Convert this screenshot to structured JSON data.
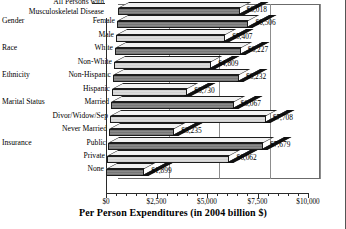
{
  "chart_data": {
    "type": "bar",
    "orientation": "horizontal",
    "title": "",
    "xlabel": "Per Person Expenditures (in 2004 billion $)",
    "ylabel": "",
    "xlim": [
      0,
      10000
    ],
    "xticks": [
      "$0",
      "$2,500",
      "$5,000",
      "$7,500",
      "$10,000"
    ],
    "xtick_values": [
      0,
      2500,
      5000,
      7500,
      10000
    ],
    "grid": true,
    "legend": "none",
    "categories": [
      "All Persons with Musculoskeletal Disease",
      "Female",
      "Male",
      "White",
      "Non-White",
      "Non-Hispanic",
      "Hispanic",
      "Married",
      "Divor/Widow/Sep",
      "Never Married",
      "Public",
      "Private",
      "None"
    ],
    "values": [
      6018,
      6506,
      5407,
      6227,
      4809,
      6232,
      3730,
      6067,
      7708,
      3235,
      7679,
      6062,
      1899
    ],
    "value_labels": [
      "$6,018",
      "$6,506",
      "$5,407",
      "$6,227",
      "$4,809",
      "$6,232",
      "$3,730",
      "$6,067",
      "$7,708",
      "$3,235",
      "$7,679",
      "$6,062",
      "$1,899"
    ],
    "groups": [
      {
        "label": "",
        "items": [
          "All Persons with Musculoskeletal Disease"
        ]
      },
      {
        "label": "Gender",
        "items": [
          "Female",
          "Male"
        ]
      },
      {
        "label": "Race",
        "items": [
          "White",
          "Non-White"
        ]
      },
      {
        "label": "Ethnicity",
        "items": [
          "Non-Hispanic",
          "Hispanic"
        ]
      },
      {
        "label": "Marital Status",
        "items": [
          "Married",
          "Divor/Widow/Sep",
          "Never Married"
        ]
      },
      {
        "label": "Insurance",
        "items": [
          "Public",
          "Private",
          "None"
        ]
      }
    ],
    "colors": {
      "dark_bar": "#8a8a8a",
      "light_bar": "#dcdcdc",
      "outline": "#1c1c1c",
      "grid": "#8d8d8d"
    }
  },
  "axis": {
    "title": "Per Person Expenditures (in 2004 billion $)",
    "ticks": [
      "$0",
      "$2,500",
      "$5,000",
      "$7,500",
      "$10,000"
    ]
  },
  "rows": [
    {
      "group": "",
      "item_line1": "All Persons with",
      "item_line2": "Musculoskeletal Disease",
      "value": "$6,018",
      "v": 6018,
      "style": "dark"
    },
    {
      "group": "Gender",
      "item_line1": "Female",
      "item_line2": "",
      "value": "$6,506",
      "v": 6506,
      "style": "dark"
    },
    {
      "group": "",
      "item_line1": "Male",
      "item_line2": "",
      "value": "$5,407",
      "v": 5407,
      "style": "light"
    },
    {
      "group": "Race",
      "item_line1": "White",
      "item_line2": "",
      "value": "$6,227",
      "v": 6227,
      "style": "dark"
    },
    {
      "group": "",
      "item_line1": "Non-White",
      "item_line2": "",
      "value": "$4,809",
      "v": 4809,
      "style": "light"
    },
    {
      "group": "Ethnicity",
      "item_line1": "Non-Hispanic",
      "item_line2": "",
      "value": "$6,232",
      "v": 6232,
      "style": "dark"
    },
    {
      "group": "",
      "item_line1": "Hispanic",
      "item_line2": "",
      "value": "$3,730",
      "v": 3730,
      "style": "light"
    },
    {
      "group": "Marital Status",
      "item_line1": "Married",
      "item_line2": "",
      "value": "$6,067",
      "v": 6067,
      "style": "dark"
    },
    {
      "group": "",
      "item_line1": "Divor/Widow/Sep",
      "item_line2": "",
      "value": "$7,708",
      "v": 7708,
      "style": "light"
    },
    {
      "group": "",
      "item_line1": "Never Married",
      "item_line2": "",
      "value": "$3,235",
      "v": 3235,
      "style": "dark"
    },
    {
      "group": "Insurance",
      "item_line1": "Public",
      "item_line2": "",
      "value": "$7,679",
      "v": 7679,
      "style": "dark"
    },
    {
      "group": "",
      "item_line1": "Private",
      "item_line2": "",
      "value": "$6,062",
      "v": 6062,
      "style": "light"
    },
    {
      "group": "",
      "item_line1": "None",
      "item_line2": "",
      "value": "$1,899",
      "v": 1899,
      "style": "dark"
    }
  ]
}
